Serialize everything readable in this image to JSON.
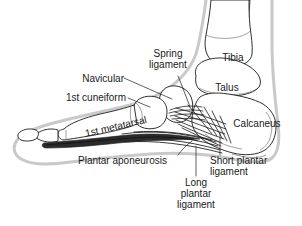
{
  "figure": {
    "background_color": "#ffffff",
    "line_color": "#1a1a1a",
    "soft_tissue_outline_color": "#c9c9c9",
    "ligament_fill_color": "#2b2b2b",
    "label_color": "#1a1a1a"
  },
  "labels": {
    "spring_ligament": "Spring\nligament",
    "navicular": "Navicular",
    "first_cuneiform": "1st cuneiform",
    "first_metatarsal": "1st metatarsal",
    "tibia": "Tibia",
    "talus": "Talus",
    "calcaneus": "Calcaneus",
    "plantar_aponeurosis": "Plantar aponeurosis",
    "short_plantar_ligament": "Short plantar\nligament",
    "long_plantar_ligament": "Long\nplantar\nligament"
  },
  "structures": {
    "bones": [
      "Tibia",
      "Talus",
      "Calcaneus",
      "Navicular",
      "1st cuneiform",
      "1st metatarsal"
    ],
    "ligaments": [
      "Spring ligament",
      "Short plantar ligament",
      "Long plantar ligament",
      "Plantar aponeurosis"
    ]
  }
}
